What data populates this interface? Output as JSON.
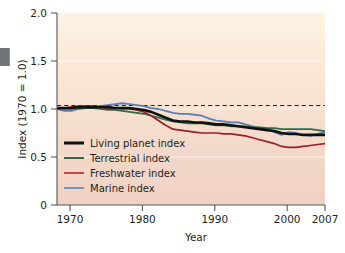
{
  "chart_data": {
    "type": "line",
    "title": "",
    "xlabel": "Year",
    "ylabel": "Index (1970 = 1.0)",
    "xlim": [
      1970,
      2007
    ],
    "ylim": [
      0,
      2.0
    ],
    "xticks": [
      "1970",
      "1980",
      "1990",
      "2000",
      "2007"
    ],
    "xtick_values": [
      1970,
      1980,
      1990,
      2000,
      2007
    ],
    "yticks": [
      "0",
      "0.5",
      "1.0",
      "1.5",
      "2.0"
    ],
    "ytick_values": [
      0,
      0.5,
      1.0,
      1.5,
      2.0
    ],
    "grid": "horizontal-faint-white",
    "legend_position": "lower-left-inside",
    "reference_line": {
      "y": 1.0,
      "style": "dashed",
      "color": "#231f20"
    },
    "plot_background": {
      "top_color": "#fdf2e2",
      "bottom_color": "#f1d4c6"
    },
    "x": [
      1970,
      1971,
      1972,
      1973,
      1974,
      1975,
      1976,
      1977,
      1978,
      1979,
      1980,
      1981,
      1982,
      1983,
      1984,
      1985,
      1986,
      1987,
      1988,
      1989,
      1990,
      1991,
      1992,
      1993,
      1994,
      1995,
      1996,
      1997,
      1998,
      1999,
      2000,
      2001,
      2002,
      2003,
      2004,
      2005,
      2006,
      2007
    ],
    "series": [
      {
        "name": "Living planet index",
        "color": "#111111",
        "width": 2.6,
        "values": [
          1.01,
          1.01,
          1.01,
          1.02,
          1.02,
          1.02,
          1.02,
          1.02,
          1.01,
          1.01,
          1.01,
          1.0,
          0.99,
          0.97,
          0.94,
          0.91,
          0.88,
          0.87,
          0.87,
          0.86,
          0.86,
          0.85,
          0.84,
          0.84,
          0.83,
          0.82,
          0.81,
          0.8,
          0.79,
          0.78,
          0.77,
          0.75,
          0.74,
          0.74,
          0.73,
          0.73,
          0.73,
          0.73
        ]
      },
      {
        "name": "Terrestrial index",
        "color": "#2f6b42",
        "width": 1.7,
        "values": [
          1.0,
          1.0,
          1.0,
          1.01,
          1.01,
          1.01,
          1.0,
          0.99,
          0.99,
          0.98,
          0.97,
          0.96,
          0.95,
          0.93,
          0.91,
          0.89,
          0.87,
          0.86,
          0.85,
          0.85,
          0.85,
          0.84,
          0.83,
          0.83,
          0.82,
          0.82,
          0.82,
          0.81,
          0.81,
          0.8,
          0.8,
          0.79,
          0.79,
          0.79,
          0.79,
          0.79,
          0.78,
          0.77
        ]
      },
      {
        "name": "Freshwater index",
        "color": "#9e1f2b",
        "width": 1.7,
        "values": [
          1.01,
          1.01,
          1.02,
          1.03,
          1.03,
          1.03,
          1.02,
          1.01,
          1.01,
          1.0,
          1.0,
          0.99,
          0.97,
          0.93,
          0.88,
          0.83,
          0.79,
          0.78,
          0.77,
          0.76,
          0.75,
          0.75,
          0.75,
          0.74,
          0.74,
          0.73,
          0.72,
          0.7,
          0.68,
          0.66,
          0.64,
          0.61,
          0.6,
          0.6,
          0.61,
          0.62,
          0.63,
          0.64
        ]
      },
      {
        "name": "Marine index",
        "color": "#5b7fb4",
        "width": 1.8,
        "values": [
          1.0,
          0.98,
          0.98,
          1.0,
          1.01,
          1.02,
          1.03,
          1.04,
          1.05,
          1.06,
          1.05,
          1.04,
          1.03,
          1.01,
          1.0,
          0.98,
          0.96,
          0.95,
          0.95,
          0.94,
          0.93,
          0.9,
          0.88,
          0.87,
          0.86,
          0.86,
          0.84,
          0.82,
          0.8,
          0.79,
          0.76,
          0.73,
          0.76,
          0.75,
          0.73,
          0.72,
          0.74,
          0.76
        ]
      }
    ],
    "legend": [
      {
        "label": "Living planet index",
        "color": "#111111"
      },
      {
        "label": "Terrestrial index",
        "color": "#2f6b42"
      },
      {
        "label": "Freshwater index",
        "color": "#c0474a"
      },
      {
        "label": "Marine index",
        "color": "#7b93b8"
      }
    ]
  }
}
